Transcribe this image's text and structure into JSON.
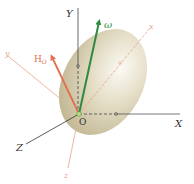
{
  "diagram": {
    "type": "3d-rigid-body-angular-momentum",
    "origin": {
      "label": "O",
      "x": 79,
      "y": 114
    },
    "body": {
      "shape": "ellipsoid",
      "cx": 103,
      "cy": 82,
      "rx": 42,
      "ry": 57,
      "rotate": 28,
      "color": "#d8d0b4"
    },
    "fixed_axes": [
      {
        "label": "Y",
        "x2": 78,
        "y2": 8,
        "lx": 68,
        "ly": 16,
        "color": "#444444"
      },
      {
        "label": "X",
        "x2": 180,
        "y2": 114,
        "lx": 176,
        "ly": 127,
        "color": "#444444"
      },
      {
        "label": "Z",
        "x2": 26,
        "y2": 144,
        "lx": 17,
        "ly": 151,
        "color": "#444444"
      }
    ],
    "body_axes": [
      {
        "label": "x",
        "x2": 150,
        "y2": 28,
        "lx": 150,
        "ly": 28,
        "color": "#e8a58a"
      },
      {
        "label": "y",
        "x2": 8,
        "y2": 56,
        "lx": 6,
        "ly": 55,
        "color": "#e8a58a"
      },
      {
        "label": "z",
        "x2": 68,
        "y2": 168,
        "lx": 65,
        "ly": 178,
        "color": "#e8a58a"
      }
    ],
    "vectors": [
      {
        "label": "ω",
        "x2": 100,
        "y2": 18,
        "lx": 104,
        "ly": 28,
        "color": "#2e8b3e"
      },
      {
        "label": "H",
        "sub": "O",
        "x2": 50,
        "y2": 53,
        "lx": 34,
        "ly": 62,
        "color": "#e0704f"
      }
    ]
  }
}
